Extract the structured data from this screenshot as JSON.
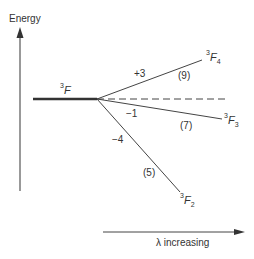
{
  "diagram": {
    "type": "energy-level splitting",
    "y_axis": {
      "label": "Energy",
      "direction": "up"
    },
    "x_axis": {
      "label": "λ increasing",
      "direction": "right"
    },
    "parent_term": {
      "multiplicity": "3",
      "letter": "F",
      "subscript": ""
    },
    "levels": [
      {
        "id": "F4",
        "multiplicity": "3",
        "letter": "F",
        "J": "4",
        "shift": "+3",
        "degeneracy": "(9)"
      },
      {
        "id": "F3",
        "multiplicity": "3",
        "letter": "F",
        "J": "3",
        "shift": "−1",
        "degeneracy": "(7)"
      },
      {
        "id": "F2",
        "multiplicity": "3",
        "letter": "F",
        "J": "2",
        "shift": "−4",
        "degeneracy": "(5)"
      }
    ],
    "reference_line": "dashed",
    "colors": {
      "line": "#333333",
      "background": "#ffffff"
    }
  }
}
